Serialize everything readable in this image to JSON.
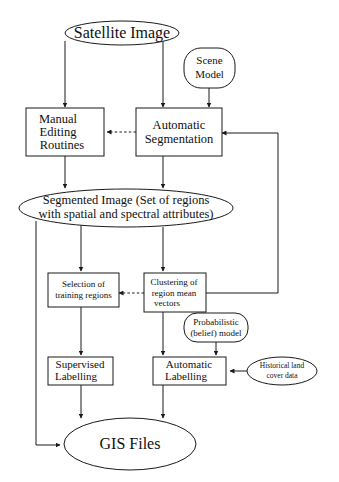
{
  "diagram": {
    "background_color": "#ffffff",
    "line_color": "#1a1a1a",
    "nodes": {
      "satellite_image": {
        "label": "Satellite Image",
        "shape": "ellipse"
      },
      "scene_model": {
        "line1": "Scene",
        "line2": "Model",
        "shape": "rounded-rect"
      },
      "manual_editing": {
        "line1": "Manual",
        "line2": "Editing",
        "line3": "Routines",
        "shape": "rect"
      },
      "automatic_segmentation": {
        "line1": "Automatic",
        "line2": "Segmentation",
        "shape": "rect"
      },
      "segmented_image": {
        "line1": "Segmented Image (Set of regions",
        "line2": "with spatial and spectral attributes)",
        "shape": "ellipse"
      },
      "selection_training": {
        "line1": "Selection of",
        "line2": "training regions",
        "shape": "rect"
      },
      "clustering": {
        "line1": "Clustering of",
        "line2": "region mean",
        "line3": "vectors",
        "shape": "rect"
      },
      "probabilistic_model": {
        "line1": "Probabilistic",
        "line2": "(belief) model",
        "shape": "rounded-rect"
      },
      "supervised_labelling": {
        "line1": "Supervised",
        "line2": "Labelling",
        "shape": "rect"
      },
      "automatic_labelling": {
        "line1": "Automatic",
        "line2": "Labelling",
        "shape": "rect"
      },
      "historical_data": {
        "line1": "Historical land",
        "line2": "cover data",
        "shape": "ellipse"
      },
      "gis_files": {
        "label": "GIS Files",
        "shape": "ellipse"
      }
    },
    "edges": [
      {
        "from": "satellite_image",
        "to": "manual_editing",
        "style": "solid"
      },
      {
        "from": "satellite_image",
        "to": "automatic_segmentation",
        "style": "solid"
      },
      {
        "from": "scene_model",
        "to": "automatic_segmentation",
        "style": "solid"
      },
      {
        "from": "automatic_segmentation",
        "to": "manual_editing",
        "style": "dashed"
      },
      {
        "from": "manual_editing",
        "to": "segmented_image",
        "style": "solid"
      },
      {
        "from": "automatic_segmentation",
        "to": "segmented_image",
        "style": "solid"
      },
      {
        "from": "segmented_image",
        "to": "selection_training",
        "style": "solid"
      },
      {
        "from": "segmented_image",
        "to": "clustering",
        "style": "solid"
      },
      {
        "from": "segmented_image",
        "to": "gis_files",
        "style": "solid"
      },
      {
        "from": "clustering",
        "to": "selection_training",
        "style": "dashed"
      },
      {
        "from": "clustering",
        "to": "automatic_segmentation",
        "style": "solid"
      },
      {
        "from": "selection_training",
        "to": "supervised_labelling",
        "style": "solid"
      },
      {
        "from": "clustering",
        "to": "automatic_labelling",
        "style": "solid"
      },
      {
        "from": "probabilistic_model",
        "to": "automatic_labelling",
        "style": "solid"
      },
      {
        "from": "historical_data",
        "to": "automatic_labelling",
        "style": "solid"
      },
      {
        "from": "supervised_labelling",
        "to": "gis_files",
        "style": "solid"
      },
      {
        "from": "automatic_labelling",
        "to": "gis_files",
        "style": "solid"
      }
    ]
  }
}
